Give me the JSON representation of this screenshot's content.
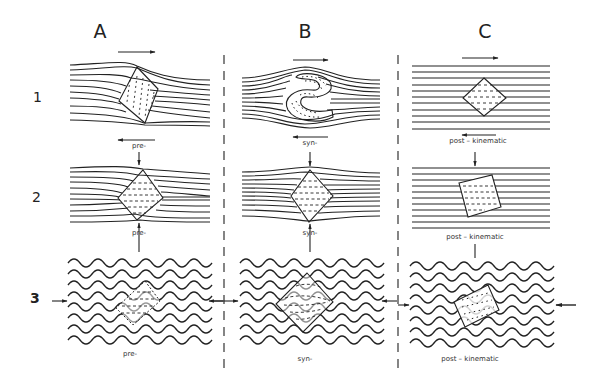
{
  "columns": [
    {
      "id": "A",
      "label": "A",
      "timing": "pre-"
    },
    {
      "id": "B",
      "label": "B",
      "timing": "syn-"
    },
    {
      "id": "C",
      "label": "C",
      "timing": "post – kinematic"
    }
  ],
  "rows": [
    {
      "id": "1",
      "label": "1"
    },
    {
      "id": "2",
      "label": "2"
    },
    {
      "id": "3",
      "label": "3"
    }
  ],
  "captions": {
    "A1": "pre-",
    "A2": "pre-",
    "A3": "pre-",
    "B1": "syn-",
    "B2": "syn-",
    "B3": "syn-",
    "C1": "post – kinematic",
    "C2": "post – kinematic",
    "C3": "post – kinematic"
  },
  "legend_notes": {
    "row1": "shear sense arrows (dextral: top →, bottom ←)",
    "row2": "vertical compression arrows",
    "row3": "horizontal shortening arrows, folded (crenulated) foliation"
  },
  "colors": {
    "ink": "#222222",
    "background": "#ffffff"
  }
}
